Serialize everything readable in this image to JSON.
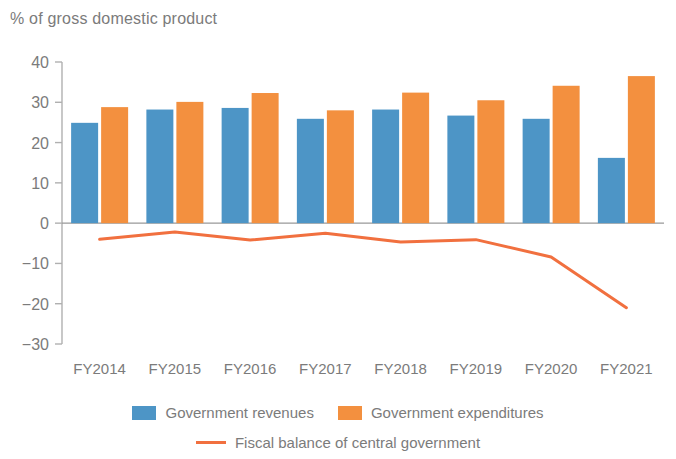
{
  "chart_data": {
    "type": "bar",
    "title": "% of gross domestic product",
    "xlabel": "",
    "ylabel": "% of gross domestic product",
    "ylim": [
      -30,
      40
    ],
    "yticks": [
      40,
      30,
      20,
      10,
      0,
      -10,
      -20,
      -30
    ],
    "ytick_labels": [
      "40",
      "30",
      "20",
      "10",
      "0",
      "−10",
      "−20",
      "−30"
    ],
    "categories": [
      "FY2014",
      "FY2015",
      "FY2016",
      "FY2017",
      "FY2018",
      "FY2019",
      "FY2020",
      "FY2021"
    ],
    "grid": false,
    "legend_position": "bottom",
    "series": [
      {
        "name": "Government revenues",
        "type": "bar",
        "color": "#4d95c6",
        "values": [
          24.9,
          28.2,
          28.6,
          25.9,
          28.2,
          26.7,
          25.9,
          16.2
        ]
      },
      {
        "name": "Government expenditures",
        "type": "bar",
        "color": "#f3903f",
        "values": [
          28.8,
          30.1,
          32.3,
          28.0,
          32.4,
          30.5,
          34.1,
          36.5
        ]
      },
      {
        "name": "Fiscal balance of central government",
        "type": "line",
        "color": "#f1703f",
        "values": [
          -4.0,
          -2.2,
          -4.2,
          -2.5,
          -4.7,
          -4.1,
          -8.4,
          -21.0
        ]
      }
    ]
  },
  "legend": {
    "items": [
      {
        "label": "Government revenues",
        "marker": "square",
        "color": "#4d95c6"
      },
      {
        "label": "Government expenditures",
        "marker": "square",
        "color": "#f3903f"
      },
      {
        "label": "Fiscal balance of central government",
        "marker": "line",
        "color": "#f1703f"
      }
    ]
  }
}
